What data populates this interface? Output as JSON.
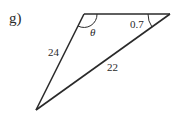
{
  "problem": {
    "part_label": "g)"
  },
  "triangle": {
    "vertices": {
      "top_left": [
        84,
        14
      ],
      "top_right": [
        170,
        14
      ],
      "bottom": [
        36,
        110
      ]
    },
    "sides": {
      "left": "24",
      "hypotenuse": "22"
    },
    "angles": {
      "top_left": "θ",
      "top_right": "0.7"
    },
    "stroke_color": "#2a2a2a"
  }
}
